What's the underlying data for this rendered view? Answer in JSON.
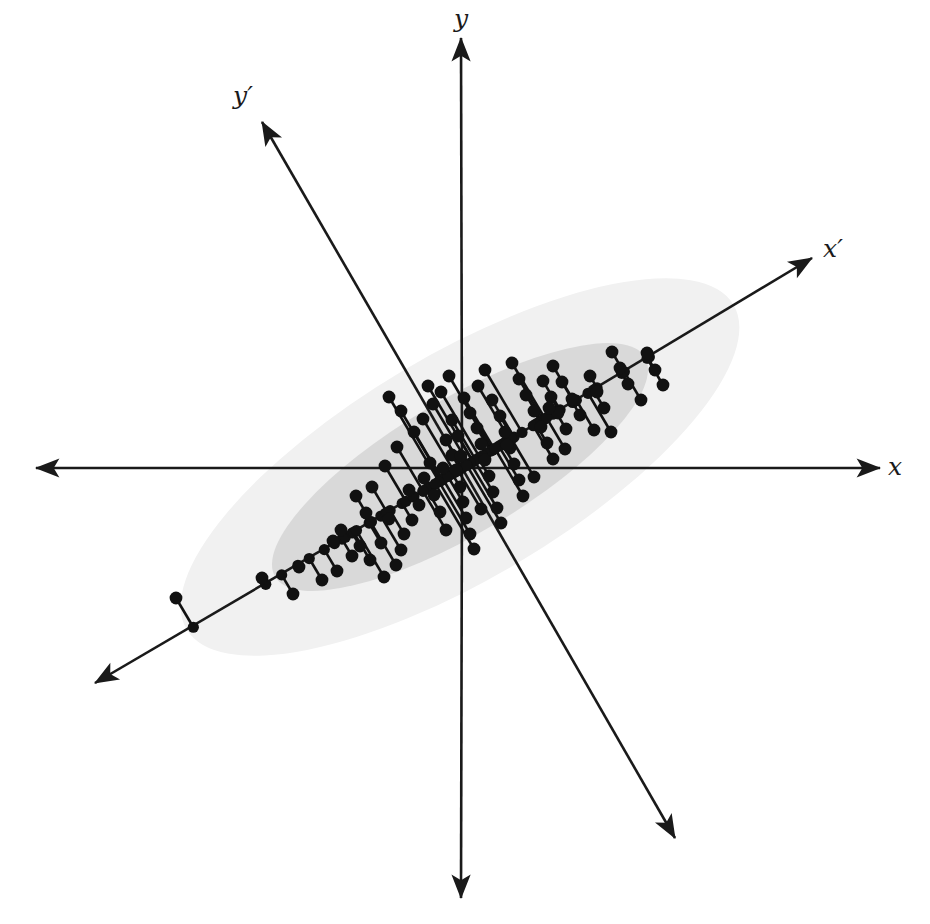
{
  "figure": {
    "width": 930,
    "height": 924,
    "background_color": "#ffffff"
  },
  "labels": {
    "x_axis": "x",
    "y_axis": "y",
    "x_prime_axis": "x′",
    "y_prime_axis": "y′"
  },
  "colors": {
    "axis": "#1a1a1a",
    "point": "#111111",
    "projection_line": "#111111",
    "ellipse_outer_fill": "#f1f1f1",
    "ellipse_inner_fill": "#d9d9d9"
  },
  "chart_data": {
    "type": "scatter",
    "title": "",
    "xlabel": "x",
    "ylabel": "y",
    "subtitle": "",
    "grid": false,
    "legend": null,
    "annotations": [
      {
        "text": "x",
        "role": "original-horizontal-axis-label",
        "px": [
          895,
          468
        ]
      },
      {
        "text": "y",
        "role": "original-vertical-axis-label",
        "px": [
          461,
          20
        ]
      },
      {
        "text": "x′",
        "role": "first-principal-component-axis-label",
        "px": [
          833,
          250
        ]
      },
      {
        "text": "y′",
        "role": "second-principal-component-axis-label",
        "px": [
          243,
          97
        ]
      }
    ],
    "origin_px": [
      462,
      468
    ],
    "rotation_deg": -30.7,
    "axes": [
      {
        "name": "x",
        "kind": "original",
        "from_px": [
          36,
          468
        ],
        "to_px": [
          880,
          468
        ],
        "double_headed": true
      },
      {
        "name": "y",
        "kind": "original",
        "from_px": [
          461,
          898
        ],
        "to_px": [
          461,
          38
        ],
        "double_headed": true
      },
      {
        "name": "x'",
        "kind": "principal-component-1",
        "from_px": [
          95,
          683
        ],
        "to_px": [
          812,
          258
        ],
        "double_headed": true
      },
      {
        "name": "y'",
        "kind": "principal-component-2",
        "from_px": [
          675,
          838
        ],
        "to_px": [
          262,
          122
        ],
        "double_headed": true
      }
    ],
    "ellipses": [
      {
        "name": "outer-confidence-ellipse",
        "center_px": [
          460,
          467
        ],
        "rx_px": 318,
        "ry_px": 112,
        "rotation_deg": -30.7,
        "fill": "#f1f1f1"
      },
      {
        "name": "inner-confidence-ellipse",
        "center_px": [
          460,
          467
        ],
        "rx_px": 215,
        "ry_px": 67,
        "rotation_deg": -30.7,
        "fill": "#d9d9d9"
      }
    ],
    "point_radius_px": 6.4,
    "projection_dot_radius_px": 5.6,
    "points_px": [
      [
        176,
        598
      ],
      [
        262,
        578
      ],
      [
        293,
        594
      ],
      [
        322,
        580
      ],
      [
        299,
        567
      ],
      [
        337,
        571
      ],
      [
        352,
        556
      ],
      [
        333,
        541
      ],
      [
        341,
        530
      ],
      [
        360,
        546
      ],
      [
        370,
        560
      ],
      [
        381,
        543
      ],
      [
        384,
        577
      ],
      [
        396,
        565
      ],
      [
        401,
        550
      ],
      [
        366,
        513
      ],
      [
        389,
        519
      ],
      [
        404,
        534
      ],
      [
        412,
        520
      ],
      [
        356,
        496
      ],
      [
        372,
        487
      ],
      [
        385,
        466
      ],
      [
        397,
        447
      ],
      [
        409,
        490
      ],
      [
        419,
        505
      ],
      [
        424,
        478
      ],
      [
        430,
        463
      ],
      [
        434,
        495
      ],
      [
        440,
        512
      ],
      [
        446,
        530
      ],
      [
        389,
        397
      ],
      [
        401,
        411
      ],
      [
        414,
        432
      ],
      [
        423,
        419
      ],
      [
        433,
        404
      ],
      [
        428,
        386
      ],
      [
        446,
        440
      ],
      [
        452,
        455
      ],
      [
        456,
        470
      ],
      [
        460,
        487
      ],
      [
        463,
        502
      ],
      [
        466,
        518
      ],
      [
        470,
        534
      ],
      [
        474,
        549
      ],
      [
        452,
        420
      ],
      [
        458,
        436
      ],
      [
        441,
        392
      ],
      [
        449,
        376
      ],
      [
        464,
        398
      ],
      [
        470,
        413
      ],
      [
        477,
        428
      ],
      [
        481,
        444
      ],
      [
        485,
        460
      ],
      [
        489,
        476
      ],
      [
        493,
        492
      ],
      [
        497,
        508
      ],
      [
        501,
        523
      ],
      [
        478,
        386
      ],
      [
        485,
        370
      ],
      [
        492,
        400
      ],
      [
        500,
        416
      ],
      [
        505,
        432
      ],
      [
        510,
        448
      ],
      [
        514,
        464
      ],
      [
        519,
        480
      ],
      [
        523,
        496
      ],
      [
        512,
        363
      ],
      [
        519,
        379
      ],
      [
        526,
        395
      ],
      [
        534,
        411
      ],
      [
        541,
        427
      ],
      [
        547,
        443
      ],
      [
        553,
        459
      ],
      [
        543,
        381
      ],
      [
        551,
        397
      ],
      [
        558,
        413
      ],
      [
        566,
        429
      ],
      [
        572,
        399
      ],
      [
        580,
        415
      ],
      [
        553,
        366
      ],
      [
        562,
        382
      ],
      [
        590,
        376
      ],
      [
        597,
        392
      ],
      [
        604,
        408
      ],
      [
        612,
        352
      ],
      [
        620,
        368
      ],
      [
        628,
        384
      ],
      [
        641,
        400
      ],
      [
        611,
        432
      ],
      [
        647,
        353
      ],
      [
        655,
        370
      ],
      [
        663,
        385
      ],
      [
        549,
        408
      ],
      [
        565,
        449
      ],
      [
        594,
        430
      ],
      [
        534,
        477
      ],
      [
        507,
        445
      ],
      [
        481,
        509
      ],
      [
        461,
        456
      ],
      [
        443,
        468
      ]
    ]
  }
}
